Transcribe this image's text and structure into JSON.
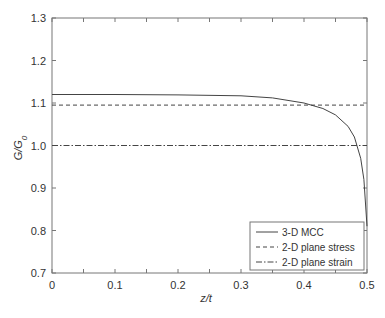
{
  "chart_data": {
    "type": "line",
    "title": "",
    "xlabel": "z/t",
    "ylabel": "G/G0",
    "xlim": [
      0,
      0.5
    ],
    "ylim": [
      0.7,
      1.3
    ],
    "xticks": [
      "0",
      "0.1",
      "0.2",
      "0.3",
      "0.4",
      "0.5"
    ],
    "yticks": [
      "0.7",
      "0.8",
      "0.9",
      "1.0",
      "1.1",
      "1.2",
      "1.3"
    ],
    "grid": false,
    "legend_position": "lower right",
    "series": [
      {
        "name": "3-D MCC",
        "style": "solid",
        "x": [
          0,
          0.1,
          0.2,
          0.3,
          0.35,
          0.4,
          0.43,
          0.45,
          0.47,
          0.48,
          0.49,
          0.495,
          0.5
        ],
        "y": [
          1.12,
          1.12,
          1.119,
          1.117,
          1.112,
          1.1,
          1.087,
          1.072,
          1.045,
          1.02,
          0.97,
          0.92,
          0.81
        ]
      },
      {
        "name": "2-D plane stress",
        "style": "dashed",
        "x": [
          0,
          0.5
        ],
        "y": [
          1.095,
          1.095
        ]
      },
      {
        "name": "2-D plane strain",
        "style": "dashdot",
        "x": [
          0,
          0.5
        ],
        "y": [
          1.0,
          1.0
        ]
      }
    ]
  },
  "legend": {
    "items": [
      "3-D MCC",
      "2-D plane stress",
      "2-D plane strain"
    ]
  },
  "axes": {
    "xlabel": "z/t",
    "ylabel_main": "G/G",
    "ylabel_sub": "0"
  }
}
